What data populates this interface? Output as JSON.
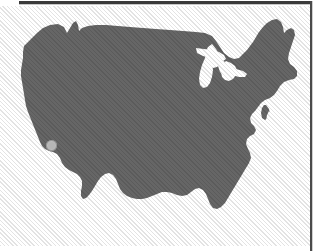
{
  "page": {
    "width": 329,
    "height": 251,
    "background_color": "#ffffff"
  },
  "rules": {
    "top_rule_color": "#3a3a3a",
    "right_rule_color": "#4a4a4a"
  },
  "figure": {
    "kind": "map",
    "region": "Contiguous United States",
    "silhouette_fill_color": "#666666",
    "background_color": "#ffffff",
    "rendering": "grayscale halftone / dithered scan",
    "has_state_borders": false,
    "labels": [],
    "water_features": [
      "Great Lakes",
      "Lake Michigan",
      "Chesapeake Bay",
      "Gulf of Mexico"
    ]
  },
  "marker": {
    "name": "location-marker",
    "shape": "circle",
    "fill_color": "#bdbdbd",
    "diameter_px": 11,
    "x_px": 51,
    "y_px": 145,
    "approximate_location": "Southern California"
  }
}
